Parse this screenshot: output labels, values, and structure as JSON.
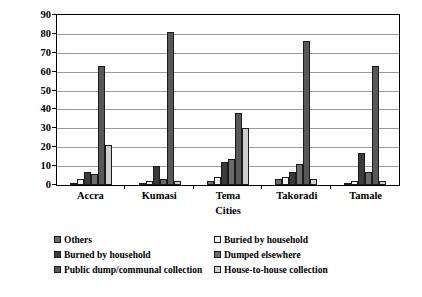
{
  "chart_data": {
    "type": "bar",
    "title": "",
    "xlabel": "Cities",
    "ylabel": "Proportion of households (%)",
    "ylim": [
      0,
      90
    ],
    "ytick_step": 10,
    "yticks": [
      90,
      80,
      70,
      60,
      50,
      40,
      30,
      20,
      10,
      0
    ],
    "grid": true,
    "legend_position": "bottom",
    "categories": [
      "Accra",
      "Kumasi",
      "Tema",
      "Takoradi",
      "Tamale"
    ],
    "series": [
      {
        "name": "Others",
        "color": "#6b6b6b",
        "values": [
          1,
          1,
          2,
          3,
          1
        ]
      },
      {
        "name": "Buried by household",
        "color": "#f2f2f2",
        "values": [
          3,
          2,
          4,
          4,
          2
        ]
      },
      {
        "name": "Burned by household",
        "color": "#3a3a3a",
        "values": [
          7,
          10,
          12,
          7,
          17
        ]
      },
      {
        "name": "Dumped elsewhere",
        "color": "#6b6b6b",
        "values": [
          6,
          3,
          14,
          11,
          7
        ]
      },
      {
        "name": "Public dump/communal collection",
        "color": "#585858",
        "values": [
          63,
          81,
          38,
          76,
          63
        ]
      },
      {
        "name": "House-to-house collection",
        "color": "#cfcfcf",
        "values": [
          21,
          2,
          30,
          3,
          2
        ]
      }
    ]
  },
  "legend": {
    "items": [
      {
        "label": "Others",
        "color": "#6b6b6b"
      },
      {
        "label": "Buried by household",
        "color": "#f2f2f2"
      },
      {
        "label": "Burned by household",
        "color": "#3a3a3a"
      },
      {
        "label": "Dumped elsewhere",
        "color": "#6b6b6b"
      },
      {
        "label": "Public dump/communal collection",
        "color": "#585858"
      },
      {
        "label": "House-to-house collection",
        "color": "#cfcfcf"
      }
    ]
  }
}
